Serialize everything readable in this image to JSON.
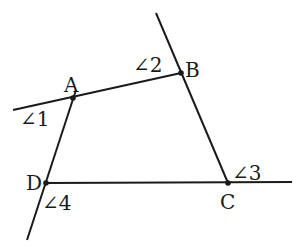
{
  "diagram": {
    "type": "quadrilateral-with-extended-sides",
    "points": {
      "A": {
        "label": "A",
        "x": 73,
        "y": 98,
        "label_x": 64,
        "label_y": 92
      },
      "B": {
        "label": "B",
        "x": 181,
        "y": 73,
        "label_x": 185,
        "label_y": 77
      },
      "C": {
        "label": "C",
        "x": 228,
        "y": 183,
        "label_x": 220,
        "label_y": 209
      },
      "D": {
        "label": "D",
        "x": 46,
        "y": 183,
        "label_x": 26,
        "label_y": 190
      }
    },
    "lines": [
      {
        "name": "line-ab",
        "x1": 13,
        "y1": 110,
        "x2": 181,
        "y2": 73
      },
      {
        "name": "line-bc",
        "x1": 156,
        "y1": 13,
        "x2": 228,
        "y2": 183
      },
      {
        "name": "line-dc",
        "x1": 46,
        "y1": 183,
        "x2": 292,
        "y2": 182
      },
      {
        "name": "line-ad",
        "x1": 76,
        "y1": 90,
        "x2": 27,
        "y2": 240
      }
    ],
    "angles": [
      {
        "label": "∠1",
        "x": 20,
        "y": 126
      },
      {
        "label": "∠2",
        "x": 133,
        "y": 72
      },
      {
        "label": "∠3",
        "x": 232,
        "y": 180
      },
      {
        "label": "∠4",
        "x": 42,
        "y": 210
      }
    ],
    "colors": {
      "ink": "#1a1a1a",
      "background": "#ffffff"
    }
  }
}
